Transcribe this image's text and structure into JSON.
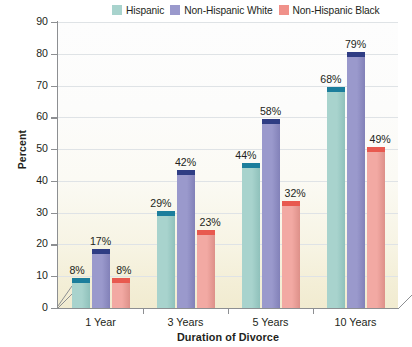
{
  "chart_data": {
    "type": "bar",
    "title": "",
    "subtitle": "",
    "xlabel": "Duration of Divorce",
    "ylabel": "Percent",
    "ylim": [
      0,
      90
    ],
    "ytick_step": 10,
    "yticks": [
      "90",
      "80",
      "70",
      "60",
      "50",
      "40",
      "30",
      "20",
      "10",
      "0"
    ],
    "grid": true,
    "grid_orientation": "horizontal",
    "legend_position": "top-right",
    "style": "3d-bar",
    "categories": [
      "1 Year",
      "3 Years",
      "5 Years",
      "10 Years"
    ],
    "series": [
      {
        "name": "Hispanic",
        "color": "#a8d3cd",
        "top_color": "#1c7e9c",
        "side_color": "#8fc1bb",
        "values": [
          8,
          29,
          44,
          68
        ],
        "labels": [
          "8%",
          "29%",
          "44%",
          "68%"
        ]
      },
      {
        "name": "Non-Hispanic White",
        "color": "#9a99cc",
        "top_color": "#2f3d84",
        "side_color": "#8281b8",
        "values": [
          17,
          42,
          58,
          79
        ],
        "labels": [
          "17%",
          "42%",
          "58%",
          "79%"
        ]
      },
      {
        "name": "Non-Hispanic Black",
        "color": "#f2a9a3",
        "top_color": "#e8594f",
        "side_color": "#dd9089",
        "values": [
          8,
          23,
          32,
          49
        ],
        "labels": [
          "8%",
          "23%",
          "32%",
          "49%"
        ]
      }
    ]
  },
  "legend": {
    "entries": [
      {
        "label": "Hispanic",
        "color": "#a8d3cd"
      },
      {
        "label": "Non-Hispanic White",
        "color": "#9a99cc"
      },
      {
        "label": "Non-Hispanic Black",
        "color": "#f0918a"
      }
    ]
  },
  "axes": {
    "y_title": "Percent",
    "x_title": "Duration of Divorce"
  },
  "colors": {
    "axis": "#8d8f92",
    "grid": "#dfe3e6",
    "text": "#231f20",
    "plot_bg_top": "#fdfdfd",
    "plot_bg_bottom": "#f1ebd0"
  }
}
